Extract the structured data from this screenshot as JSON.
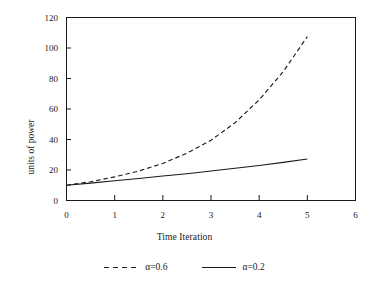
{
  "chart_data": {
    "type": "line",
    "title": "",
    "xlabel": "Time Iteration",
    "ylabel": "units of power",
    "xlim": [
      0,
      6
    ],
    "ylim": [
      0,
      120
    ],
    "xticks": [
      0,
      1,
      2,
      3,
      4,
      5,
      6
    ],
    "yticks": [
      0,
      20,
      40,
      60,
      80,
      100,
      120
    ],
    "xtick_labels": [
      "0",
      "1",
      "2",
      "3",
      "4",
      "5",
      "6"
    ],
    "ytick_labels": [
      "0",
      "20",
      "40",
      "60",
      "80",
      "100",
      "120"
    ],
    "grid": false,
    "legend_position": "below",
    "frame": true,
    "series": [
      {
        "name": "α=0.6",
        "style": "dashed",
        "color": "#1a1a1a",
        "x": [
          0.0,
          0.5,
          1.0,
          1.5,
          2.0,
          2.5,
          3.0,
          3.5,
          4.0,
          4.5,
          5.0
        ],
        "values": [
          10.0,
          12.3,
          15.5,
          19.3,
          24.3,
          31.0,
          39.5,
          51.0,
          66.0,
          84.5,
          107.5
        ]
      },
      {
        "name": "α=0.2",
        "style": "solid",
        "color": "#1a1a1a",
        "x": [
          0.0,
          0.5,
          1.0,
          1.5,
          2.0,
          2.5,
          3.0,
          3.5,
          4.0,
          4.5,
          5.0
        ],
        "values": [
          10.0,
          11.4,
          12.9,
          14.4,
          16.0,
          17.6,
          19.3,
          21.1,
          23.0,
          25.0,
          27.2
        ]
      }
    ]
  },
  "legend": {
    "entries": [
      {
        "label": "α=0.6",
        "style": "dashed"
      },
      {
        "label": "α=0.2",
        "style": "solid"
      }
    ]
  }
}
